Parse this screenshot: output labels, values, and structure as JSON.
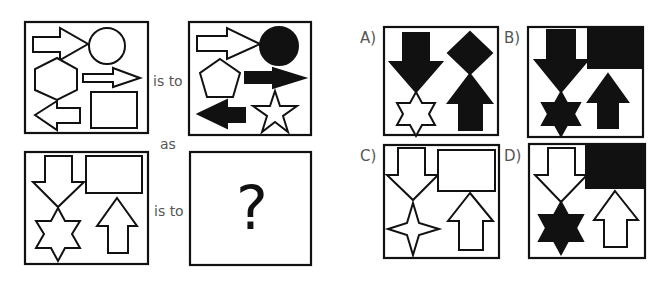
{
  "puzzle": {
    "type": "visual-analogy",
    "connector_is_to": "is to",
    "connector_as": "as",
    "unknown_symbol": "?",
    "stroke_color": "#111111",
    "label_color": "#555555",
    "panels": [
      {
        "id": "source",
        "shapes": [
          "hollow right arrow",
          "hollow circle",
          "hollow hexagon",
          "hollow thin right arrow",
          "hollow left arrow",
          "hollow rectangle"
        ]
      },
      {
        "id": "source-result",
        "shapes": [
          "hollow right arrow",
          "filled circle",
          "hollow pentagon",
          "filled right arrow",
          "filled left arrow",
          "hollow star"
        ]
      },
      {
        "id": "target",
        "shapes": [
          "hollow down arrow",
          "hollow rectangle",
          "hollow six-point star",
          "hollow up arrow"
        ]
      },
      {
        "id": "target-result",
        "shapes": [
          "?"
        ]
      }
    ]
  },
  "options": [
    {
      "label": "A)",
      "shapes": [
        "filled down arrow",
        "filled diamond",
        "hollow six-point star",
        "filled up arrow"
      ]
    },
    {
      "label": "B)",
      "shapes": [
        "filled down arrow",
        "filled rectangle",
        "filled six-point star",
        "filled up arrow"
      ]
    },
    {
      "label": "C)",
      "shapes": [
        "hollow down arrow",
        "hollow rectangle",
        "hollow four-point star",
        "hollow up arrow"
      ]
    },
    {
      "label": "D)",
      "shapes": [
        "hollow down arrow",
        "filled rectangle",
        "filled six-point star",
        "hollow up arrow"
      ]
    }
  ]
}
